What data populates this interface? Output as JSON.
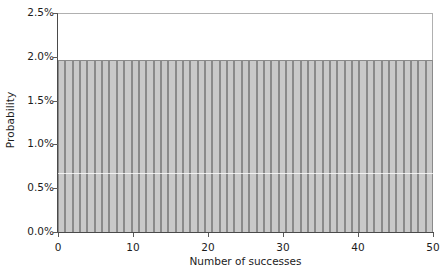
{
  "chart_data": {
    "type": "bar",
    "title": "",
    "subtitle": "",
    "xlabel": "Number of successes",
    "ylabel": "Probability",
    "xlim": [
      0,
      50
    ],
    "ylim": [
      0,
      2.5
    ],
    "y_unit": "%",
    "grid": false,
    "legend": null,
    "legend_position": "none",
    "annotations": [],
    "x_tick_labels": [
      "0",
      "10",
      "20",
      "30",
      "40",
      "50"
    ],
    "x_tick_values": [
      0,
      10,
      20,
      30,
      40,
      50
    ],
    "y_tick_labels": [
      "0.0%",
      "0.5%",
      "1.0%",
      "1.5%",
      "2.0%",
      "2.5%"
    ],
    "y_tick_values": [
      0,
      0.5,
      1.0,
      1.5,
      2.0,
      2.5
    ],
    "categories": [
      0,
      1,
      2,
      3,
      4,
      5,
      6,
      7,
      8,
      9,
      10,
      11,
      12,
      13,
      14,
      15,
      16,
      17,
      18,
      19,
      20,
      21,
      22,
      23,
      24,
      25,
      26,
      27,
      28,
      29,
      30,
      31,
      32,
      33,
      34,
      35,
      36,
      37,
      38,
      39,
      40,
      41,
      42,
      43,
      44,
      45,
      46,
      47,
      48,
      49,
      50
    ],
    "values": [
      1.96,
      1.96,
      1.96,
      1.96,
      1.96,
      1.96,
      1.96,
      1.96,
      1.96,
      1.96,
      1.96,
      1.96,
      1.96,
      1.96,
      1.96,
      1.96,
      1.96,
      1.96,
      1.96,
      1.96,
      1.96,
      1.96,
      1.96,
      1.96,
      1.96,
      1.96,
      1.96,
      1.96,
      1.96,
      1.96,
      1.96,
      1.96,
      1.96,
      1.96,
      1.96,
      1.96,
      1.96,
      1.96,
      1.96,
      1.96,
      1.96,
      1.96,
      1.96,
      1.96,
      1.96,
      1.96,
      1.96,
      1.96,
      1.96,
      1.96,
      1.96
    ],
    "series": [
      {
        "name": "Probability",
        "values": [
          1.96,
          1.96,
          1.96,
          1.96,
          1.96,
          1.96,
          1.96,
          1.96,
          1.96,
          1.96,
          1.96,
          1.96,
          1.96,
          1.96,
          1.96,
          1.96,
          1.96,
          1.96,
          1.96,
          1.96,
          1.96,
          1.96,
          1.96,
          1.96,
          1.96,
          1.96,
          1.96,
          1.96,
          1.96,
          1.96,
          1.96,
          1.96,
          1.96,
          1.96,
          1.96,
          1.96,
          1.96,
          1.96,
          1.96,
          1.96,
          1.96,
          1.96,
          1.96,
          1.96,
          1.96,
          1.96,
          1.96,
          1.96,
          1.96,
          1.96,
          1.96
        ]
      }
    ],
    "colors": {
      "bar_fill": "#c9c9c9",
      "bar_border": "#8a8a8a",
      "axis": "#4a4a4a",
      "frame": "#b0b0b0",
      "background": "#ffffff",
      "text": "#1c1c1c"
    }
  }
}
